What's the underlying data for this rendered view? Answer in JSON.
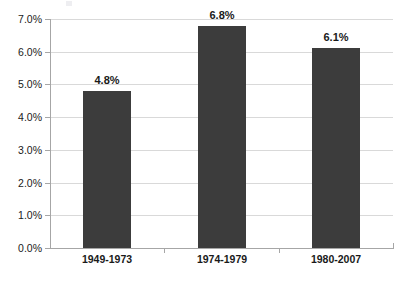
{
  "chart_data": {
    "type": "bar",
    "title": "",
    "subtitle": "",
    "xlabel": "",
    "ylabel": "",
    "categories": [
      "1949-1973",
      "1974-1979",
      "1980-2007"
    ],
    "values": [
      4.8,
      6.8,
      6.1
    ],
    "value_labels": [
      "4.8%",
      "6.8%",
      "6.1%"
    ],
    "ylim": [
      0,
      7
    ],
    "ytick_values": [
      0,
      1,
      2,
      3,
      4,
      5,
      6,
      7
    ],
    "ytick_labels": [
      "0.0%",
      "1.0%",
      "2.0%",
      "3.0%",
      "4.0%",
      "5.0%",
      "6.0%",
      "7.0%"
    ],
    "grid": "horizontal",
    "legend": "none",
    "series": [
      {
        "name": "",
        "values": [
          4.8,
          6.8,
          6.1
        ]
      }
    ],
    "colors": {
      "bar": "#3c3c3c",
      "gridline": "#d9d9d9",
      "axis": "#a6a6a6",
      "text": "#1a1a1a",
      "background": "#ffffff"
    }
  }
}
